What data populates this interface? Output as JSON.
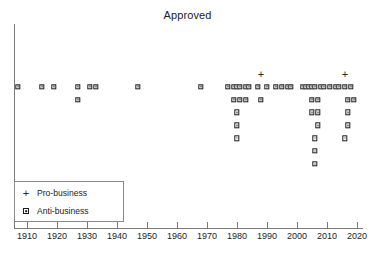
{
  "chart_data": {
    "type": "scatter",
    "title": "Approved",
    "xlabel": "",
    "ylabel": "",
    "xlim": [
      1905,
      2021
    ],
    "ylim": [
      0,
      10
    ],
    "grid": false,
    "legend_position": "bottom-left",
    "xticks": [
      1910,
      1920,
      1930,
      1940,
      1950,
      1960,
      1970,
      1980,
      1990,
      2000,
      2010,
      2020
    ],
    "xtick_labels": [
      "1910",
      "1920",
      "1930",
      "1940",
      "1950",
      "1960",
      "1970",
      "1980",
      "1990",
      "2000",
      "2010",
      "2020"
    ],
    "yticks": [],
    "ytick_labels": [],
    "series": [
      {
        "name": "Pro-business",
        "marker": "plus",
        "color": "#2a2a2a",
        "points": [
          {
            "x": 1988,
            "y": 2
          },
          {
            "x": 2016,
            "y": 2
          }
        ]
      },
      {
        "name": "Anti-business",
        "marker": "square-dot",
        "color": "#1b1b1b",
        "points": [
          {
            "x": 1907,
            "y": 1
          },
          {
            "x": 1915,
            "y": 1
          },
          {
            "x": 1919,
            "y": 1
          },
          {
            "x": 1927,
            "y": 1
          },
          {
            "x": 1931,
            "y": 1
          },
          {
            "x": 1933,
            "y": 1
          },
          {
            "x": 1947,
            "y": 1
          },
          {
            "x": 1968,
            "y": 1
          },
          {
            "x": 1977,
            "y": 1
          },
          {
            "x": 1979,
            "y": 1
          },
          {
            "x": 1980,
            "y": 1
          },
          {
            "x": 1981,
            "y": 1
          },
          {
            "x": 1983,
            "y": 1
          },
          {
            "x": 1984,
            "y": 1
          },
          {
            "x": 1987,
            "y": 1
          },
          {
            "x": 1990,
            "y": 1
          },
          {
            "x": 1993,
            "y": 1
          },
          {
            "x": 1995,
            "y": 1
          },
          {
            "x": 1997,
            "y": 1
          },
          {
            "x": 1998,
            "y": 1
          },
          {
            "x": 2002,
            "y": 1
          },
          {
            "x": 2003,
            "y": 1
          },
          {
            "x": 2004,
            "y": 1
          },
          {
            "x": 2005,
            "y": 1
          },
          {
            "x": 2006,
            "y": 1
          },
          {
            "x": 2008,
            "y": 1
          },
          {
            "x": 2009,
            "y": 1
          },
          {
            "x": 2011,
            "y": 1
          },
          {
            "x": 2013,
            "y": 1
          },
          {
            "x": 2014,
            "y": 1
          },
          {
            "x": 2016,
            "y": 1
          },
          {
            "x": 2018,
            "y": 1
          },
          {
            "x": 1927,
            "y": 0
          },
          {
            "x": 1979,
            "y": 0
          },
          {
            "x": 1981,
            "y": 0
          },
          {
            "x": 1983,
            "y": 0
          },
          {
            "x": 1988,
            "y": 0
          },
          {
            "x": 2005,
            "y": 0
          },
          {
            "x": 2007,
            "y": 0
          },
          {
            "x": 2017,
            "y": 0
          },
          {
            "x": 2019,
            "y": 0
          },
          {
            "x": 1980,
            "y": -1
          },
          {
            "x": 2005,
            "y": -1
          },
          {
            "x": 2007,
            "y": -1
          },
          {
            "x": 2017,
            "y": -1
          },
          {
            "x": 1980,
            "y": -2
          },
          {
            "x": 2007,
            "y": -2
          },
          {
            "x": 2017,
            "y": -2
          },
          {
            "x": 1980,
            "y": -3
          },
          {
            "x": 2006,
            "y": -3
          },
          {
            "x": 2016,
            "y": -3
          },
          {
            "x": 2006,
            "y": -4
          },
          {
            "x": 2006,
            "y": -5
          }
        ]
      }
    ]
  },
  "legend": {
    "items": [
      {
        "label": "Pro-business",
        "marker": "plus-icon"
      },
      {
        "label": "Anti-business",
        "marker": "square-dot-icon"
      }
    ]
  }
}
